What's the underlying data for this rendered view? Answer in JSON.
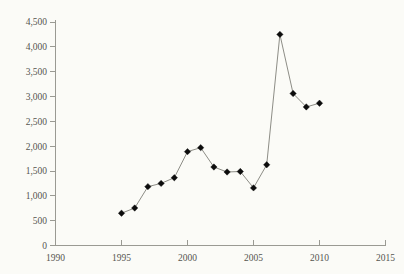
{
  "chart_data": {
    "type": "line",
    "title": "",
    "subtitle": "",
    "xlabel": "",
    "ylabel": "",
    "xlim": [
      1990,
      2015
    ],
    "ylim": [
      0,
      4500
    ],
    "grid": false,
    "legend": null,
    "legend_position": "none",
    "x_ticks": [
      1990,
      1995,
      2000,
      2005,
      2010,
      2015
    ],
    "x_tick_labels": [
      "1990",
      "1995",
      "2000",
      "2005",
      "2010",
      "2015"
    ],
    "y_ticks": [
      0,
      500,
      1000,
      1500,
      2000,
      2500,
      3000,
      3500,
      4000,
      4500
    ],
    "y_tick_labels": [
      "0",
      "500",
      "1,000",
      "1,500",
      "2,000",
      "2,500",
      "3,000",
      "3,500",
      "4,000",
      "4,500"
    ],
    "x": [
      1995,
      1996,
      1997,
      1998,
      1999,
      2000,
      2001,
      2002,
      2003,
      2004,
      2005,
      2006,
      2007,
      2008,
      2009,
      2010
    ],
    "values": [
      650,
      755,
      1185,
      1250,
      1365,
      1890,
      1970,
      1580,
      1480,
      1490,
      1160,
      1625,
      4250,
      3060,
      2790,
      2865
    ],
    "series": [
      {
        "name": "series-1",
        "marker": "diamond",
        "marker_color": "#0c0c0c",
        "line_color": "#8d8d86",
        "values": [
          650,
          755,
          1185,
          1250,
          1365,
          1890,
          1970,
          1580,
          1480,
          1490,
          1160,
          1625,
          4250,
          3060,
          2790,
          2865
        ]
      }
    ],
    "annotations": []
  },
  "style": {
    "background": "#fbfbf7",
    "axis_color": "#9a9a93",
    "label_color": "#55554f",
    "marker_color": "#0c0c0c",
    "line_color": "#8d8d86"
  }
}
